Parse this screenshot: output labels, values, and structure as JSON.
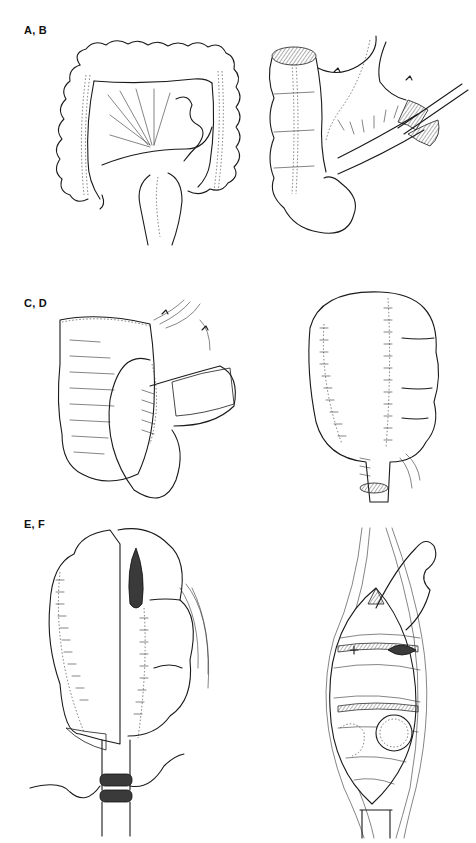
{
  "figure": {
    "panels": [
      {
        "id": "A",
        "row_label": "A, B",
        "description": "Colon with mesentery — full large bowel overview"
      },
      {
        "id": "B",
        "row_label": "A, B",
        "description": "Mobilized colon segment with clamped vessels"
      },
      {
        "id": "C",
        "row_label": "C, D",
        "description": "Folded colon being sutured into pouch"
      },
      {
        "id": "D",
        "row_label": "C, D",
        "description": "Completed sutured colonic pouch with outlet"
      },
      {
        "id": "E",
        "row_label": "E, F",
        "description": "Pouch with anastomosis to anal canal"
      },
      {
        "id": "F",
        "row_label": "E, F",
        "description": "Operative field showing pelvic closure with stoma"
      }
    ],
    "row_labels": [
      "A, B",
      "C, D",
      "E, F"
    ]
  }
}
